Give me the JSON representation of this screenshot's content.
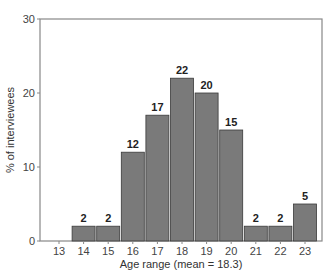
{
  "chart_data": {
    "type": "bar",
    "title": "",
    "xlabel": "Age range (mean = 18.3)",
    "ylabel": "% of interviewees",
    "categories": [
      "13",
      "14",
      "15",
      "16",
      "17",
      "18",
      "19",
      "20",
      "21",
      "22",
      "23"
    ],
    "values": [
      0,
      2,
      2,
      12,
      17,
      22,
      20,
      15,
      2,
      2,
      5
    ],
    "value_labels": [
      "",
      "2",
      "2",
      "12",
      "17",
      "22",
      "20",
      "15",
      "2",
      "2",
      "5"
    ],
    "ylim": [
      0,
      30
    ],
    "yticks": [
      0,
      10,
      20,
      30
    ],
    "grid": false,
    "legend": null,
    "bar_color": "#7a7a7a",
    "bar_edge_color": "#3a3a3a",
    "frame_color": "#888888"
  }
}
